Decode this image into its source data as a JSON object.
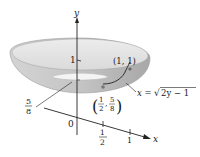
{
  "diagram": {
    "type": "3d-surface-of-revolution",
    "axes": {
      "x_label": "x",
      "y_label": "y",
      "origin_label": "0"
    },
    "ticks": {
      "y_one": "1",
      "x_half_num": "1",
      "x_half_den": "2",
      "x_one": "1"
    },
    "annotations": {
      "point_top": "(1, 1)",
      "curve_eq_lhs": "x = ",
      "curve_eq_sqrt": "√",
      "curve_eq_radicand": "2y − 1",
      "point_mid_num1": "1",
      "point_mid_den1": "2",
      "point_mid_num2": "5",
      "point_mid_den2": "8",
      "depth_num": "5",
      "depth_den": "8"
    },
    "colors": {
      "bowl_outer": "#c8c8c8",
      "bowl_inner": "#e6e6e6",
      "bowl_rim": "#9a9a9a",
      "axis": "#222222",
      "dot": "#777777"
    }
  }
}
